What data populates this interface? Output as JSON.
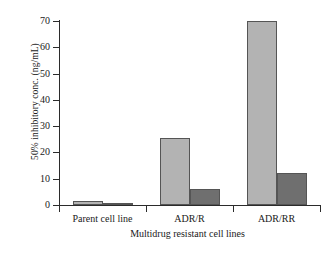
{
  "chart_data": {
    "type": "bar",
    "title": "",
    "subtitle": "",
    "xlabel": "Multidrug resistant cell lines",
    "ylabel": "50% inhibitory conc. (ng/mL)",
    "categories": [
      "Parent cell line",
      "ADR/R",
      "ADR/RR"
    ],
    "series": [
      {
        "name": "series-1",
        "color": "#b3b3b3",
        "values": [
          1.6,
          25.5,
          70.0
        ]
      },
      {
        "name": "series-2",
        "color": "#6f6f6f",
        "values": [
          0.9,
          6.2,
          12.2
        ]
      }
    ],
    "ylim": [
      0,
      70
    ],
    "yticks": [
      0,
      10,
      20,
      30,
      40,
      50,
      60,
      70
    ],
    "ytick_labels": [
      "0",
      "10",
      "20",
      "30",
      "40",
      "50",
      "60",
      "70"
    ],
    "grid": false,
    "legend": "none",
    "axis_color": "#2b2b2b",
    "background": "#ffffff"
  }
}
